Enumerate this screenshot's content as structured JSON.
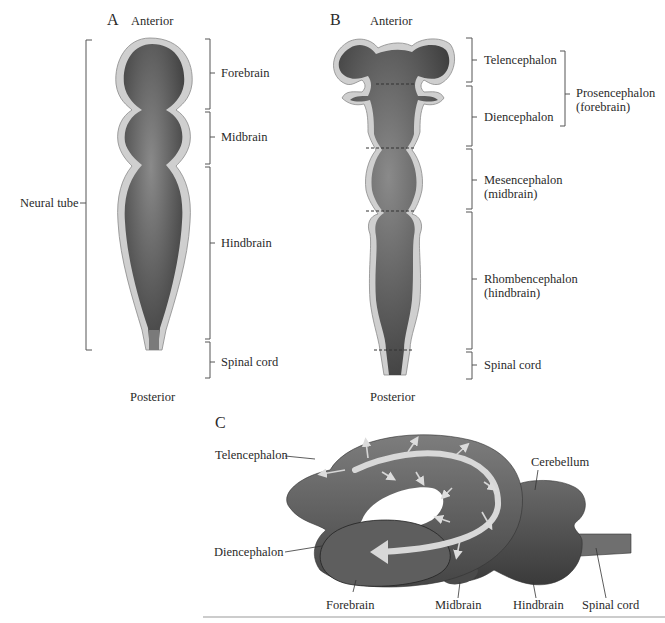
{
  "panels": {
    "A": {
      "letter": "A",
      "top_label": "Anterior",
      "bottom_label": "Posterior",
      "left_bracket_label": "Neural tube",
      "regions": [
        "Forebrain",
        "Midbrain",
        "Hindbrain",
        "Spinal cord"
      ]
    },
    "B": {
      "letter": "B",
      "top_label": "Anterior",
      "bottom_label": "Posterior",
      "regions": [
        {
          "line1": "Telencephalon",
          "line2": ""
        },
        {
          "line1": "Diencephalon",
          "line2": ""
        },
        {
          "line1": "Mesencephalon",
          "line2": "(midbrain)"
        },
        {
          "line1": "Rhombencephalon",
          "line2": "(hindbrain)"
        },
        {
          "line1": "Spinal cord",
          "line2": ""
        }
      ],
      "group_label": {
        "line1": "Prosencephalon",
        "line2": "(forebrain)"
      }
    },
    "C": {
      "letter": "C",
      "labels": {
        "telencephalon": "Telencephalon",
        "diencephalon": "Diencephalon",
        "cerebellum": "Cerebellum",
        "forebrain": "Forebrain",
        "midbrain": "Midbrain",
        "hindbrain": "Hindbrain",
        "spinal_cord": "Spinal cord"
      }
    }
  },
  "colors": {
    "tissue_dark": "#4a4a4a",
    "tissue_light": "#8a8a8a",
    "wall": "#cfcfcf",
    "arrow": "#d8d8d8"
  }
}
